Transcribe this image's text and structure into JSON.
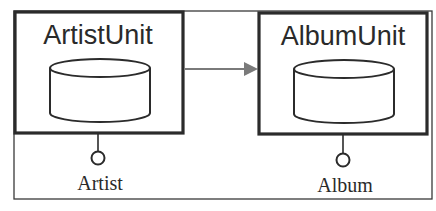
{
  "diagram": {
    "type": "component-diagram",
    "units": [
      {
        "name": "ArtistUnit",
        "interface": "Artist"
      },
      {
        "name": "AlbumUnit",
        "interface": "Album"
      }
    ],
    "connections": [
      {
        "from": "ArtistUnit",
        "to": "AlbumUnit",
        "kind": "dependency-arrow"
      }
    ],
    "colors": {
      "border": "#2b2b2b",
      "arrow": "#7a7a7a",
      "background": "#ffffff"
    }
  }
}
